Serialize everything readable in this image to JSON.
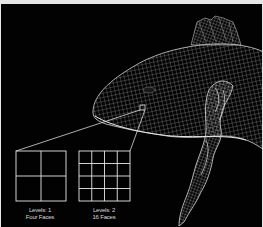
{
  "figure": {
    "zoom_box": {
      "x": 139,
      "y": 105,
      "size": 5
    },
    "panels": [
      {
        "title": "Levels: 1",
        "subtitle": "Four Faces",
        "divisions": 2
      },
      {
        "title": "Levels: 2",
        "subtitle": "16 Faces",
        "divisions": 4
      }
    ],
    "colors": {
      "background": "#020202",
      "lines": "#e0e0e0",
      "frame": "#e6e6e6"
    }
  }
}
